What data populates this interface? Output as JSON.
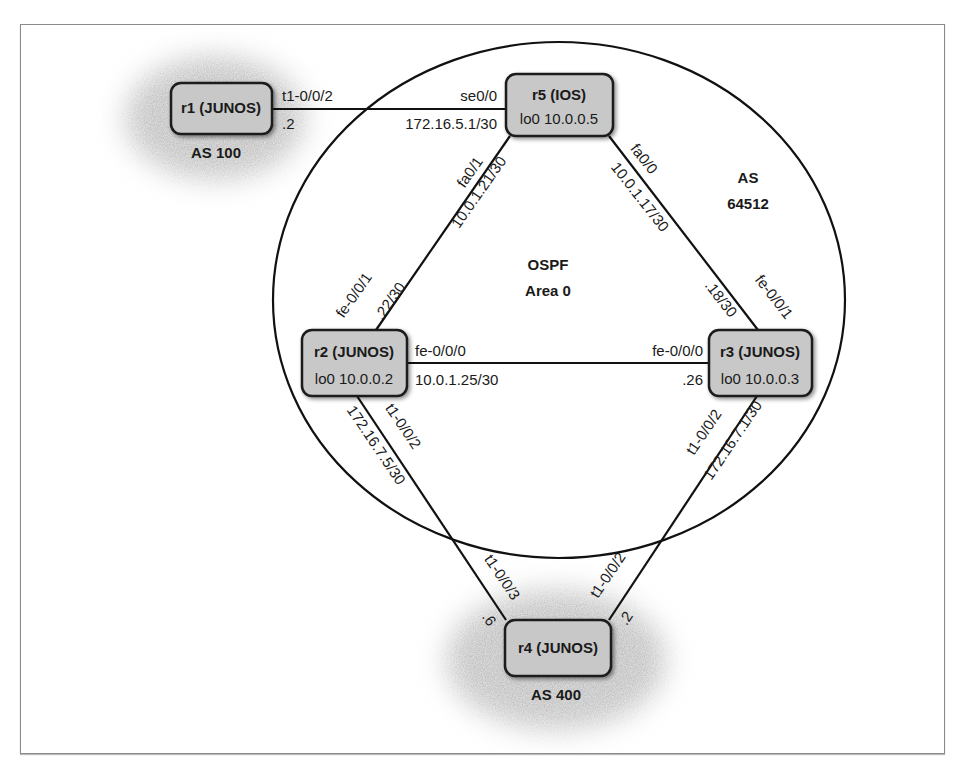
{
  "diagram": {
    "ospf_label": "OSPF",
    "area_label": "Area 0",
    "as_main": {
      "line1": "AS",
      "line2": "64512"
    },
    "routers": [
      {
        "id": "r1",
        "name": "r1 (JUNOS)",
        "loopback": "",
        "as": "AS 100"
      },
      {
        "id": "r5",
        "name": "r5 (IOS)",
        "loopback": "lo0 10.0.0.5",
        "as": ""
      },
      {
        "id": "r2",
        "name": "r2 (JUNOS)",
        "loopback": "lo0 10.0.0.2",
        "as": ""
      },
      {
        "id": "r3",
        "name": "r3 (JUNOS)",
        "loopback": "lo0 10.0.0.3",
        "as": ""
      },
      {
        "id": "r4",
        "name": "r4 (JUNOS)",
        "loopback": "",
        "as": "AS 400"
      }
    ],
    "links": {
      "r1_r5": {
        "r1_if": "t1-0/0/2",
        "r1_addr": ".2",
        "r5_if": "se0/0",
        "subnet": "172.16.5.1/30"
      },
      "r5_r2": {
        "r5_if": "fa0/1",
        "subnet": "10.0.1.21/30",
        "r2_if": "fe-0/0/1",
        "r2_addr": ".22/30"
      },
      "r5_r3": {
        "r5_if": "fa0/0",
        "subnet": "10.0.1.17/30",
        "r3_if": "fe-0/0/1",
        "r3_addr": ".18/30"
      },
      "r2_r3": {
        "r2_if": "fe-0/0/0",
        "subnet": "10.0.1.25/30",
        "r3_if": "fe-0/0/0",
        "r3_addr": ".26"
      },
      "r2_r4": {
        "r2_if": "t1-0/0/2",
        "subnet": "172.16.7.5/30",
        "r4_if": "t1-0/0/3",
        "r4_addr": ".6"
      },
      "r3_r4": {
        "r3_if": "t1-0/0/2",
        "subnet": "172.16.7.1/30",
        "r4_if": "t1-0/0/2",
        "r4_addr": ".2"
      }
    }
  }
}
